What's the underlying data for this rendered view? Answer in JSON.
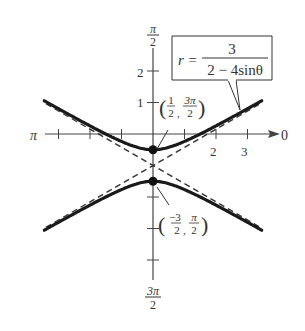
{
  "chart_data": {
    "type": "line",
    "title": "",
    "equation": {
      "lhs": "r =",
      "numerator": "3",
      "denominator": "2 − 4sinθ"
    },
    "plot_kind": "polar graph (hyperbola)",
    "axes": {
      "polar_axis_label": "0",
      "left_label": "π",
      "top_label": {
        "num": "π",
        "den": "2"
      },
      "bottom_label": {
        "num": "3π",
        "den": "2"
      },
      "x_tick_labels": [
        {
          "value": 2,
          "text": "2"
        },
        {
          "value": 3,
          "text": "3"
        }
      ],
      "y_tick_labels": [
        {
          "value": 1,
          "text": "1"
        },
        {
          "value": 2,
          "text": "2"
        }
      ],
      "x_ticks": [
        -3,
        -2,
        -1,
        1,
        2,
        3
      ],
      "y_ticks": [
        -4,
        -3,
        -2,
        1,
        2
      ],
      "xlim": [
        -3.5,
        4
      ],
      "ylim": [
        -4.5,
        2.8
      ],
      "grid": false
    },
    "series": [
      {
        "name": "upper branch",
        "style": "solid",
        "description": "(y+1)^2/(1/4) - x^2/(3/4) = 1, upper branch",
        "x": [
          -3.4,
          -3,
          -2,
          -1,
          -0.5,
          0,
          0.5,
          1,
          2,
          3,
          3.4
        ],
        "y": [
          1.03,
          0.8,
          0.22,
          -0.24,
          -0.42,
          -0.5,
          -0.42,
          -0.24,
          0.22,
          0.8,
          1.03
        ]
      },
      {
        "name": "lower branch",
        "style": "solid",
        "description": "lower branch",
        "x": [
          -3.4,
          -3,
          -2,
          -1,
          -0.5,
          0,
          0.5,
          1,
          2,
          3,
          3.4
        ],
        "y": [
          -3.03,
          -2.8,
          -2.22,
          -1.76,
          -1.58,
          -1.5,
          -1.58,
          -1.76,
          -2.22,
          -2.8,
          -3.03
        ]
      },
      {
        "name": "asymptote 1",
        "style": "dashed",
        "description": "y = -1 + x/√3",
        "x": [
          -3.4,
          3.4
        ],
        "y": [
          -2.96,
          0.96
        ]
      },
      {
        "name": "asymptote 2",
        "style": "dashed",
        "description": "y = -1 - x/√3",
        "x": [
          -3.4,
          3.4
        ],
        "y": [
          0.96,
          -2.96
        ]
      }
    ],
    "points": [
      {
        "x": 0,
        "y": -0.5,
        "label": {
          "open": "(",
          "a_num": "1",
          "a_den": "2",
          "b_num": "3π",
          "b_den": "2",
          "close": ")"
        },
        "text": "(1/2, 3π/2)"
      },
      {
        "x": 0,
        "y": -1.5,
        "label": {
          "open": "(",
          "a_num": "−3",
          "a_den": "2",
          "b_num": "π",
          "b_den": "2",
          "close": ")"
        },
        "text": "(−3/2, π/2)"
      }
    ],
    "annotations": [
      "r = 3/(2 − 4sinθ)",
      "(1/2, 3π/2)",
      "(−3/2, π/2)"
    ]
  }
}
